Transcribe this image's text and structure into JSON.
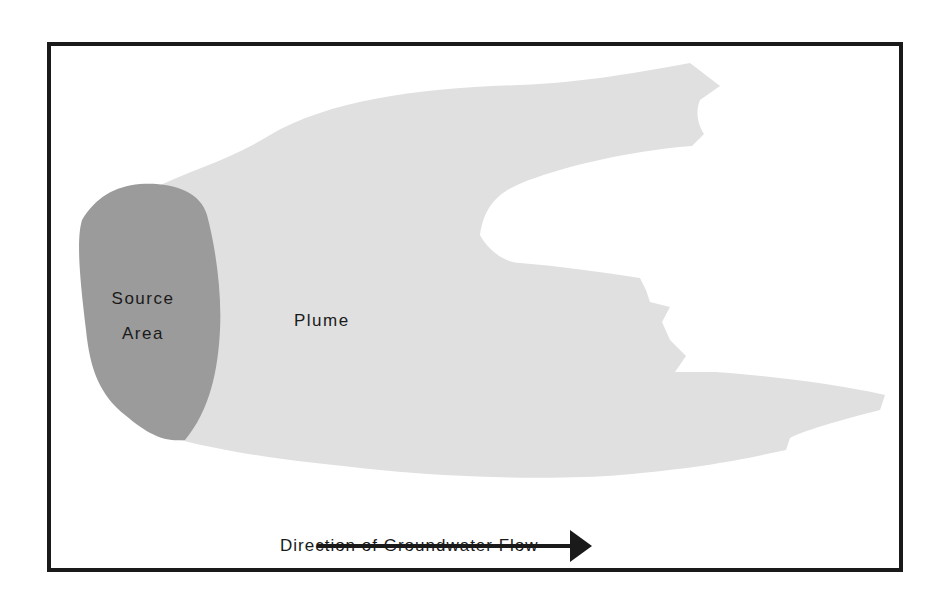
{
  "diagram": {
    "labels": {
      "source_line1": "Source",
      "source_line2": "Area",
      "plume": "Plume",
      "flow_direction": "Direction of Groundwater Flow"
    },
    "colors": {
      "background": "#ffffff",
      "frame": "#1a1a1a",
      "source_area": "#9b9b9b",
      "plume": "#e0e0e0",
      "arrow": "#1a1a1a",
      "text": "#1a1a1a"
    },
    "elements": [
      {
        "id": "source-area",
        "label": "Source Area",
        "shape": "dark gray oval at left"
      },
      {
        "id": "plume",
        "label": "Plume",
        "shape": "light gray irregular plume extending right from source"
      },
      {
        "id": "flow-arrow",
        "label": "Direction of Groundwater Flow",
        "direction": "left-to-right"
      }
    ]
  }
}
